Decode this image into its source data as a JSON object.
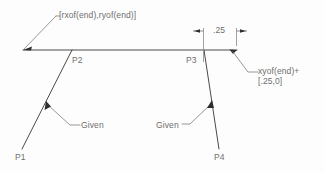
{
  "diagram": {
    "title_label": "[rxof(end),ryof(end)]",
    "dimension_label": ".25",
    "end_offset_label": "xyof(end)+\n[.25,0]",
    "points": {
      "p1": "P1",
      "p2": "P2",
      "p3": "P3",
      "p4": "P4"
    },
    "annotations": {
      "given_left": "Given",
      "given_right": "Given"
    },
    "colors": {
      "background": "#fdfdfd",
      "geometry_stroke": "#4a4a4a",
      "leader_stroke": "#7d7d7d",
      "text": "#6e6e6e",
      "arrow_fill": "#2e2e2e"
    }
  }
}
